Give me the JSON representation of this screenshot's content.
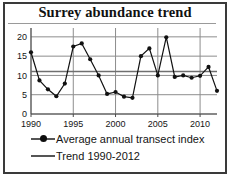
{
  "chart_data": {
    "type": "line",
    "title": "Surrey abundance trend",
    "xlabel": "",
    "ylabel": "",
    "xlim": [
      1990,
      2012
    ],
    "ylim": [
      0,
      21
    ],
    "grid": true,
    "legend_position": "bottom",
    "x_ticks": [
      "1990",
      "1995",
      "2000",
      "2005",
      "2010"
    ],
    "x_tick_values": [
      1990,
      1995,
      2000,
      2005,
      2010
    ],
    "y_ticks": [
      "0",
      "5",
      "10",
      "15",
      "20"
    ],
    "y_tick_values": [
      0,
      5,
      10,
      15,
      20
    ],
    "x": [
      1990,
      1991,
      1992,
      1993,
      1994,
      1995,
      1996,
      1997,
      1998,
      1999,
      2000,
      2001,
      2002,
      2003,
      2004,
      2005,
      2006,
      2007,
      2008,
      2009,
      2010,
      2011,
      2012
    ],
    "series": [
      {
        "name": "Average annual transect index",
        "type": "line-marker",
        "color": "#111111",
        "values": [
          16.0,
          8.7,
          6.4,
          4.6,
          7.9,
          17.5,
          18.3,
          14.2,
          10.0,
          5.2,
          5.7,
          4.5,
          4.2,
          15.0,
          17.0,
          10.0,
          19.9,
          9.6,
          10.0,
          9.4,
          9.9,
          12.2,
          6.0
        ]
      },
      {
        "name": "Trend 1990-2012",
        "type": "line",
        "color": "#6f6f6f",
        "values": [
          11.0,
          11.0,
          11.0,
          11.0,
          11.0,
          11.0,
          11.0,
          11.0,
          11.0,
          11.0,
          11.0,
          11.0,
          11.0,
          11.0,
          11.0,
          11.0,
          11.0,
          11.0,
          11.0,
          11.0,
          11.0,
          11.0,
          11.0
        ]
      }
    ],
    "legend": [
      {
        "label": "Average annual transect index",
        "marker": "line-with-dot"
      },
      {
        "label": "Trend 1990-2012",
        "marker": "line"
      }
    ]
  }
}
